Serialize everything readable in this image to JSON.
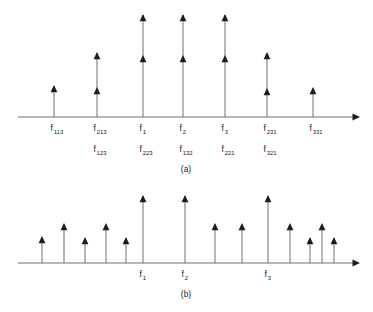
{
  "figure": {
    "background_color": "#ffffff",
    "axis_color": "#6e6e6e",
    "stem_color": "#7a7a7a",
    "arrow_color": "#1c1c1c",
    "text_color": "#1a1a1a"
  },
  "chart_data": {
    "type": "bar",
    "title": "",
    "subtitle": "",
    "xlabel": "",
    "ylabel": "",
    "grid": false,
    "legend": null,
    "panels": [
      {
        "id": "a",
        "caption": "(a)",
        "caption_x": 186,
        "caption_y": 172,
        "axis": {
          "x_start": 18,
          "x_end": 355,
          "y": 117,
          "has_arrow_head": true
        },
        "rows": [
          {
            "row": 0,
            "label_y": 131
          },
          {
            "row": 1,
            "label_y": 152
          }
        ],
        "lines": [
          {
            "name": "tall-line-1",
            "x": 143,
            "top_y": 14,
            "arrow_head_y": 14,
            "base_y": 117
          },
          {
            "name": "tall-line-2",
            "x": 183,
            "top_y": 14,
            "arrow_head_y": 14,
            "base_y": 117
          },
          {
            "name": "tall-line-3",
            "x": 225,
            "top_y": 14,
            "arrow_head_y": 14,
            "base_y": 117
          },
          {
            "name": "mid-line-213",
            "x": 97,
            "top_y": 52,
            "arrow_head_y": 52,
            "base_y": 117
          },
          {
            "name": "mid-line-231",
            "x": 267,
            "top_y": 52,
            "arrow_head_y": 52,
            "base_y": 117
          },
          {
            "name": "short-line-113",
            "x": 54,
            "top_y": 85,
            "arrow_head_y": 85,
            "base_y": 117
          },
          {
            "name": "short-line-331",
            "x": 313,
            "top_y": 87,
            "arrow_head_y": 87,
            "base_y": 117
          }
        ],
        "secondary_arrow_heads": [
          {
            "name": "sub-head-123",
            "x": 97,
            "y": 87
          },
          {
            "name": "sub-head-223",
            "x": 143,
            "y": 55
          },
          {
            "name": "sub-head-132",
            "x": 183,
            "y": 55
          },
          {
            "name": "sub-head-221",
            "x": 225,
            "y": 55
          },
          {
            "name": "sub-head-321",
            "x": 267,
            "y": 88
          }
        ],
        "labels": [
          {
            "name": "label-f113",
            "x": 54,
            "y": 131,
            "base": "f",
            "sub": "113"
          },
          {
            "name": "label-f213",
            "x": 97,
            "y": 131,
            "base": "f",
            "sub": "213"
          },
          {
            "name": "label-f1",
            "x": 143,
            "y": 131,
            "base": "f",
            "sub": "1"
          },
          {
            "name": "label-f2",
            "x": 183,
            "y": 131,
            "base": "f",
            "sub": "2"
          },
          {
            "name": "label-f3",
            "x": 225,
            "y": 131,
            "base": "f",
            "sub": "3"
          },
          {
            "name": "label-f231",
            "x": 267,
            "y": 131,
            "base": "f",
            "sub": "231"
          },
          {
            "name": "label-f331",
            "x": 313,
            "y": 131,
            "base": "f",
            "sub": "331"
          },
          {
            "name": "label-f123",
            "x": 97,
            "y": 152,
            "base": "f",
            "sub": "123"
          },
          {
            "name": "label-f223",
            "x": 143,
            "y": 152,
            "base": "f",
            "sub": "223"
          },
          {
            "name": "label-f132",
            "x": 183,
            "y": 152,
            "base": "f",
            "sub": "132"
          },
          {
            "name": "label-f221",
            "x": 225,
            "y": 152,
            "base": "f",
            "sub": "221"
          },
          {
            "name": "label-f321",
            "x": 267,
            "y": 152,
            "base": "f",
            "sub": "321"
          }
        ]
      },
      {
        "id": "b",
        "caption": "(b)",
        "caption_x": 186,
        "caption_y": 297,
        "axis": {
          "x_start": 18,
          "x_end": 355,
          "y": 263,
          "has_arrow_head": true
        },
        "lines": [
          {
            "name": "line-b-1",
            "x": 42,
            "top_y": 236,
            "base_y": 263
          },
          {
            "name": "line-b-2",
            "x": 64,
            "top_y": 223,
            "base_y": 263
          },
          {
            "name": "line-b-3",
            "x": 85,
            "top_y": 237,
            "base_y": 263
          },
          {
            "name": "line-b-4",
            "x": 106,
            "top_y": 223,
            "base_y": 263
          },
          {
            "name": "line-b-5",
            "x": 126,
            "top_y": 237,
            "base_y": 263
          },
          {
            "name": "line-b-6",
            "x": 143,
            "top_y": 195,
            "base_y": 263
          },
          {
            "name": "line-b-7",
            "x": 185,
            "top_y": 195,
            "base_y": 263
          },
          {
            "name": "line-b-8",
            "x": 215,
            "top_y": 223,
            "base_y": 263
          },
          {
            "name": "line-b-9",
            "x": 242,
            "top_y": 223,
            "base_y": 263
          },
          {
            "name": "line-b-10",
            "x": 268,
            "top_y": 195,
            "base_y": 263
          },
          {
            "name": "line-b-11",
            "x": 290,
            "top_y": 223,
            "base_y": 263
          },
          {
            "name": "line-b-12",
            "x": 310,
            "top_y": 237,
            "base_y": 263
          },
          {
            "name": "line-b-13",
            "x": 322,
            "top_y": 223,
            "base_y": 263
          },
          {
            "name": "line-b-14",
            "x": 334,
            "top_y": 237,
            "base_y": 263
          }
        ],
        "labels": [
          {
            "name": "label-b-f1",
            "x": 143,
            "y": 277,
            "base": "f",
            "sub": "1"
          },
          {
            "name": "label-b-f2",
            "x": 185,
            "y": 277,
            "base": "f",
            "sub": "2"
          },
          {
            "name": "label-b-f3",
            "x": 268,
            "y": 277,
            "base": "f",
            "sub": "3"
          }
        ]
      }
    ]
  }
}
